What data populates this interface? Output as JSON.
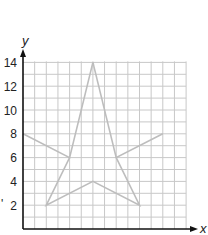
{
  "chart_data": {
    "type": "line",
    "title": "",
    "xlabel": "x",
    "ylabel": "y",
    "xlim": [
      0,
      14
    ],
    "ylim": [
      0,
      14
    ],
    "grid": true,
    "y_tick_labels": [
      "2",
      "4",
      "6",
      "8",
      "10",
      "12",
      "14"
    ],
    "series": [
      {
        "name": "star",
        "closed": true,
        "points": [
          {
            "x": 6,
            "y": 14
          },
          {
            "x": 8,
            "y": 6
          },
          {
            "x": 12,
            "y": 8
          },
          {
            "x": 8,
            "y": 6
          },
          {
            "x": 10,
            "y": 2
          },
          {
            "x": 6,
            "y": 4
          },
          {
            "x": 2,
            "y": 2
          },
          {
            "x": 4,
            "y": 6
          },
          {
            "x": 0,
            "y": 8
          },
          {
            "x": 4,
            "y": 6
          }
        ],
        "color": "#bdbdbd"
      }
    ]
  },
  "axes": {
    "x_label": "x",
    "y_label": "y",
    "stray_mark": "'"
  }
}
